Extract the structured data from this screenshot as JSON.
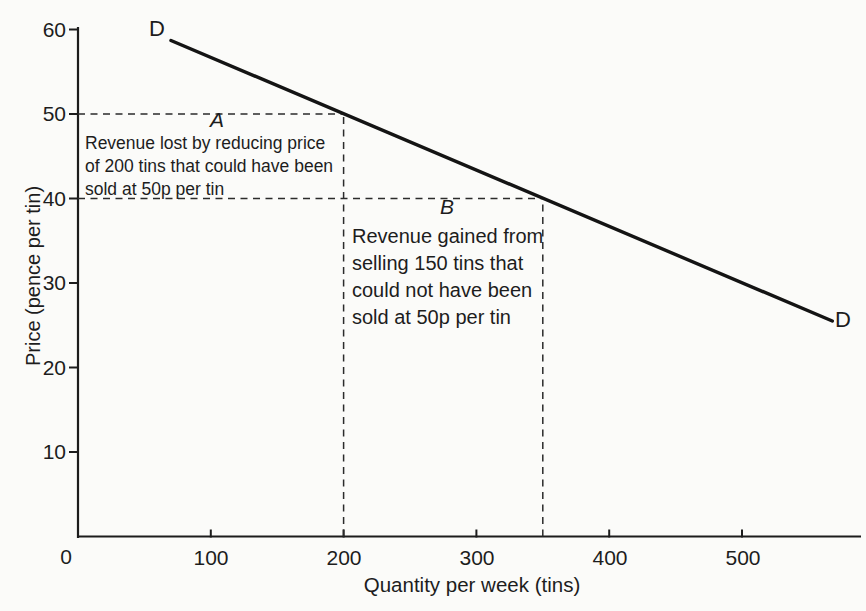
{
  "chart_data": {
    "type": "line",
    "title": "",
    "xlabel": "Quantity per week (tins)",
    "ylabel": "Price (pence per tin)",
    "xlim": [
      0,
      590
    ],
    "ylim": [
      0,
      62
    ],
    "x_ticks": [
      100,
      200,
      300,
      400,
      500
    ],
    "y_ticks": [
      10,
      20,
      30,
      40,
      50,
      60
    ],
    "origin_label": "0",
    "grid": false,
    "legend": "none",
    "series": [
      {
        "name": "D",
        "points": [
          [
            70,
            58.7
          ],
          [
            568,
            25.5
          ]
        ],
        "color": "#141414",
        "style": "solid"
      }
    ],
    "highlighted_points": [
      {
        "quantity": 200,
        "price": 50
      },
      {
        "quantity": 350,
        "price": 40
      }
    ],
    "guide_lines": [
      {
        "orientation": "horizontal",
        "price": 50,
        "from_quantity": 0,
        "to_quantity": 200
      },
      {
        "orientation": "vertical",
        "quantity": 200,
        "from_price": 0,
        "to_price": 50
      },
      {
        "orientation": "horizontal",
        "price": 40,
        "from_quantity": 0,
        "to_quantity": 350
      },
      {
        "orientation": "vertical",
        "quantity": 350,
        "from_price": 0,
        "to_price": 40
      }
    ],
    "annotations": {
      "region_a": {
        "label": "A",
        "lines": [
          "Revenue lost by reducing price",
          "of 200 tins that could have been",
          "sold at 50p per tin"
        ]
      },
      "region_b": {
        "label": "B",
        "lines": [
          "Revenue gained from",
          "selling 150 tins that",
          "could not have been",
          "sold at 50p per tin"
        ]
      }
    }
  }
}
